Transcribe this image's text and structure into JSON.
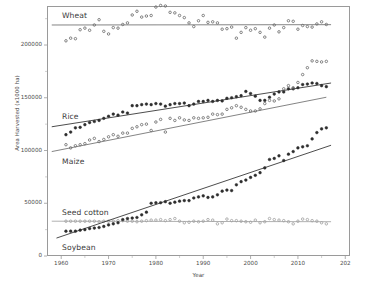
{
  "chart_data": {
    "type": "scatter",
    "title": "",
    "xlabel": "Year",
    "ylabel": "Area Harvested (x1000 ha)",
    "xlim": [
      1957,
      2021
    ],
    "ylim": [
      0,
      237000
    ],
    "xticks": [
      1960,
      1970,
      1980,
      1990,
      2000,
      2010,
      2020
    ],
    "xticklabels": [
      "1960",
      "1970",
      "1980",
      "1990",
      "2000",
      "2010",
      "202"
    ],
    "yticks": [
      0,
      50000,
      100000,
      150000,
      200000
    ],
    "yticklabels": [
      "0",
      "50000",
      "100000",
      "150000",
      "200000"
    ],
    "grid": false,
    "legend_position": "inline-annotations",
    "series": [
      {
        "name": "Wheat",
        "label": "Wheat",
        "color": "#6e6e6e",
        "marker": "circle-open",
        "trend": {
          "type": "linear",
          "x0": 1958,
          "y0": 219000,
          "x1": 2017,
          "y1": 219300
        },
        "x": [
          1961,
          1962,
          1963,
          1964,
          1965,
          1966,
          1967,
          1968,
          1969,
          1970,
          1971,
          1972,
          1973,
          1974,
          1975,
          1976,
          1977,
          1978,
          1979,
          1980,
          1981,
          1982,
          1983,
          1984,
          1985,
          1986,
          1987,
          1988,
          1989,
          1990,
          1991,
          1992,
          1993,
          1994,
          1995,
          1996,
          1997,
          1998,
          1999,
          2000,
          2001,
          2002,
          2003,
          2004,
          2005,
          2006,
          2007,
          2008,
          2009,
          2010,
          2011,
          2012,
          2013,
          2014,
          2015,
          2016
        ],
        "y": [
          204000,
          206500,
          206000,
          214500,
          216000,
          214000,
          219000,
          224000,
          213000,
          210500,
          216500,
          216000,
          219500,
          221000,
          228500,
          232000,
          226500,
          227500,
          228000,
          236000,
          237500,
          237000,
          231000,
          230500,
          228000,
          226000,
          221000,
          217500,
          223000,
          228000,
          221500,
          222000,
          221000,
          215000,
          215500,
          217000,
          206500,
          212000,
          216500,
          214000,
          215500,
          212000,
          207500,
          216000,
          219000,
          212500,
          216500,
          223000,
          222500,
          215000,
          218500,
          217500,
          217000,
          220000,
          222000,
          219500
        ]
      },
      {
        "name": "Rice",
        "label": "Rice",
        "color": "#2d2d2d",
        "marker": "circle-filled",
        "trend": {
          "type": "linear",
          "x0": 1958,
          "y0": 122500,
          "x1": 2017,
          "y1": 164000
        },
        "x": [
          1961,
          1962,
          1963,
          1964,
          1965,
          1966,
          1967,
          1968,
          1969,
          1970,
          1971,
          1972,
          1973,
          1974,
          1975,
          1976,
          1977,
          1978,
          1979,
          1980,
          1981,
          1982,
          1983,
          1984,
          1985,
          1986,
          1987,
          1988,
          1989,
          1990,
          1991,
          1992,
          1993,
          1994,
          1995,
          1996,
          1997,
          1998,
          1999,
          2000,
          2001,
          2002,
          2003,
          2004,
          2005,
          2006,
          2007,
          2008,
          2009,
          2010,
          2011,
          2012,
          2013,
          2014,
          2015,
          2016
        ],
        "y": [
          115000,
          117500,
          121500,
          122000,
          124500,
          126500,
          127500,
          128500,
          130500,
          132500,
          134500,
          133500,
          136500,
          135500,
          142500,
          142500,
          143500,
          144000,
          143500,
          144500,
          144000,
          142000,
          143500,
          144500,
          144500,
          145000,
          142500,
          144000,
          146500,
          146500,
          147500,
          146500,
          147500,
          147000,
          149500,
          150000,
          151000,
          152000,
          156000,
          154000,
          151500,
          147500,
          147500,
          150500,
          153500,
          155500,
          155500,
          158500,
          158500,
          159500,
          162500,
          163000,
          164000,
          163500,
          161500,
          160500
        ]
      },
      {
        "name": "Maize",
        "label": "Maize",
        "color": "#6e6e6e",
        "marker": "circle-open",
        "trend": {
          "type": "linear",
          "x0": 1958,
          "y0": 99000,
          "x1": 2016,
          "y1": 150500
        },
        "x": [
          1961,
          1962,
          1963,
          1964,
          1965,
          1966,
          1967,
          1968,
          1969,
          1970,
          1971,
          1972,
          1973,
          1974,
          1975,
          1976,
          1977,
          1978,
          1979,
          1980,
          1981,
          1982,
          1983,
          1984,
          1985,
          1986,
          1987,
          1988,
          1989,
          1990,
          1991,
          1992,
          1993,
          1994,
          1995,
          1996,
          1997,
          1998,
          1999,
          2000,
          2001,
          2002,
          2003,
          2004,
          2005,
          2006,
          2007,
          2008,
          2009,
          2010,
          2011,
          2012,
          2013,
          2014,
          2015,
          2016
        ],
        "y": [
          105500,
          102500,
          104500,
          105500,
          106500,
          110000,
          111500,
          108500,
          110500,
          113000,
          115000,
          113500,
          116500,
          116500,
          121000,
          122500,
          124500,
          125000,
          119000,
          127000,
          129500,
          117500,
          130500,
          128500,
          131000,
          129000,
          128500,
          131000,
          130500,
          131000,
          131500,
          134500,
          134000,
          134500,
          139000,
          140500,
          142500,
          141000,
          139000,
          137500,
          137500,
          139500,
          144500,
          147500,
          147000,
          149000,
          158500,
          161500,
          159500,
          164500,
          172000,
          178500,
          185000,
          184500,
          184000,
          184500
        ]
      },
      {
        "name": "Seed cotton",
        "label": "Seed cotton",
        "color": "#a2a2a2",
        "marker": "circle-open",
        "trend": {
          "type": "linear",
          "x0": 1958,
          "y0": 33000,
          "x1": 2017,
          "y1": 32500
        },
        "x": [
          1961,
          1962,
          1963,
          1964,
          1965,
          1966,
          1967,
          1968,
          1969,
          1970,
          1971,
          1972,
          1973,
          1974,
          1975,
          1976,
          1977,
          1978,
          1979,
          1980,
          1981,
          1982,
          1983,
          1984,
          1985,
          1986,
          1987,
          1988,
          1989,
          1990,
          1991,
          1992,
          1993,
          1994,
          1995,
          1996,
          1997,
          1998,
          1999,
          2000,
          2001,
          2002,
          2003,
          2004,
          2005,
          2006,
          2007,
          2008,
          2009,
          2010,
          2011,
          2012,
          2013,
          2014,
          2015,
          2016
        ],
        "y": [
          33000,
          33000,
          33000,
          33000,
          33000,
          33000,
          33000,
          32500,
          33000,
          33000,
          33000,
          33500,
          33500,
          33000,
          33000,
          32500,
          33000,
          33500,
          34000,
          34000,
          34500,
          33500,
          34500,
          35500,
          33000,
          31500,
          32000,
          33000,
          32500,
          33000,
          34500,
          34000,
          30500,
          31500,
          35000,
          33500,
          33500,
          33000,
          32500,
          32000,
          34000,
          31500,
          32500,
          35500,
          34500,
          34000,
          33500,
          32500,
          30500,
          33000,
          35000,
          34500,
          33500,
          33000,
          31500,
          30500
        ]
      },
      {
        "name": "Soybean",
        "label": "Soybean",
        "color": "#2d2d2d",
        "marker": "circle-filled",
        "trend": {
          "type": "linear",
          "x0": 1959,
          "y0": 17000,
          "x1": 2017,
          "y1": 105000
        },
        "x": [
          1961,
          1962,
          1963,
          1964,
          1965,
          1966,
          1967,
          1968,
          1969,
          1970,
          1971,
          1972,
          1973,
          1974,
          1975,
          1976,
          1977,
          1978,
          1979,
          1980,
          1981,
          1982,
          1983,
          1984,
          1985,
          1986,
          1987,
          1988,
          1989,
          1990,
          1991,
          1992,
          1993,
          1994,
          1995,
          1996,
          1997,
          1998,
          1999,
          2000,
          2001,
          2002,
          2003,
          2004,
          2005,
          2006,
          2007,
          2008,
          2009,
          2010,
          2011,
          2012,
          2013,
          2014,
          2015,
          2016
        ],
        "y": [
          23500,
          23500,
          23500,
          24500,
          25000,
          26000,
          26500,
          27000,
          28000,
          29500,
          30500,
          31500,
          34500,
          35500,
          36000,
          36500,
          39000,
          41500,
          50000,
          50500,
          50500,
          51500,
          50000,
          51000,
          52000,
          52500,
          52500,
          55000,
          56000,
          57000,
          55500,
          56000,
          58000,
          61500,
          62500,
          62000,
          67500,
          70500,
          72000,
          74500,
          76500,
          79000,
          83500,
          91500,
          92500,
          95000,
          90500,
          96500,
          99000,
          102500,
          103500,
          104500,
          111000,
          117000,
          120500,
          121500
        ]
      }
    ]
  }
}
